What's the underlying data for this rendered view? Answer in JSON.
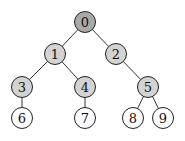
{
  "tree": {
    "colors": {
      "root": "#a9a9a9",
      "internal": "#d3d3d3",
      "leaf": "#ffffff"
    },
    "nodes": [
      {
        "id": "0",
        "label": "0",
        "x": 85,
        "y": 22,
        "kind": "root"
      },
      {
        "id": "1",
        "label": "1",
        "x": 55,
        "y": 54,
        "kind": "internal"
      },
      {
        "id": "2",
        "label": "2",
        "x": 116,
        "y": 54,
        "kind": "internal"
      },
      {
        "id": "3",
        "label": "3",
        "x": 22,
        "y": 87,
        "kind": "internal"
      },
      {
        "id": "4",
        "label": "4",
        "x": 85,
        "y": 87,
        "kind": "internal"
      },
      {
        "id": "5",
        "label": "5",
        "x": 148,
        "y": 87,
        "kind": "internal"
      },
      {
        "id": "6",
        "label": "6",
        "x": 22,
        "y": 118,
        "kind": "leaf"
      },
      {
        "id": "7",
        "label": "7",
        "x": 85,
        "y": 118,
        "kind": "leaf"
      },
      {
        "id": "8",
        "label": "8",
        "x": 133,
        "y": 118,
        "kind": "leaf"
      },
      {
        "id": "9",
        "label": "9",
        "x": 163,
        "y": 118,
        "kind": "leaf"
      }
    ],
    "edges": [
      [
        "0",
        "1"
      ],
      [
        "0",
        "2"
      ],
      [
        "1",
        "3"
      ],
      [
        "1",
        "4"
      ],
      [
        "2",
        "5"
      ],
      [
        "3",
        "6"
      ],
      [
        "4",
        "7"
      ],
      [
        "5",
        "8"
      ],
      [
        "5",
        "9"
      ]
    ],
    "radius": 10.5
  }
}
